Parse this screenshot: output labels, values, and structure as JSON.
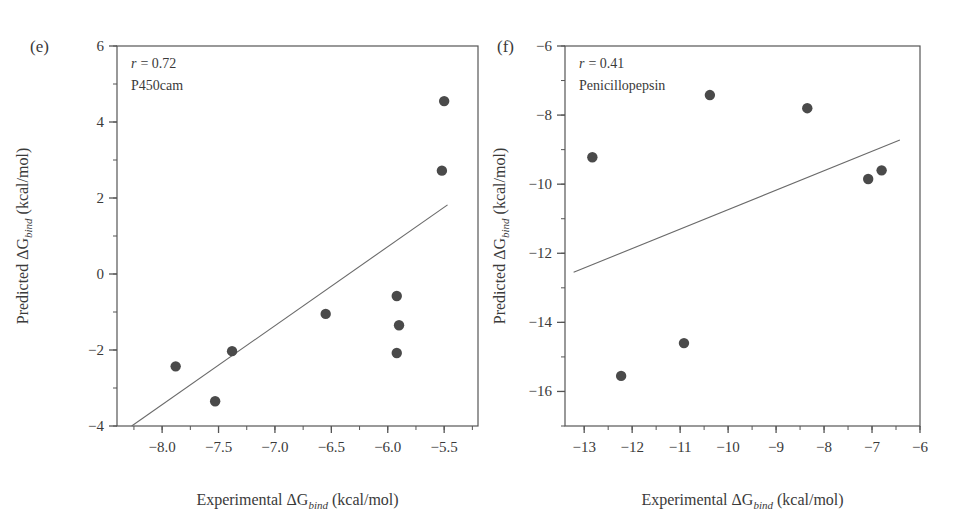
{
  "figure": {
    "background": "#ffffff",
    "marker_color": "#4a4a4a",
    "axis_color": "#555555",
    "line_color": "#6a6a6a"
  },
  "chart_data": [
    {
      "type": "scatter",
      "panel": "(e)",
      "title": "P450cam",
      "correlation_label": "r = 0.72",
      "correlation_symbol": "r",
      "correlation_value": "= 0.72",
      "system": "P450cam",
      "xlabel_prefix": "Experimental ",
      "xlabel_symbol": "ΔG",
      "xlabel_sub": "bind",
      "xlabel_unit": " (kcal/mol)",
      "ylabel_prefix": "Predicted ",
      "ylabel_symbol": "ΔG",
      "ylabel_sub": "bind",
      "ylabel_unit": " (kcal/mol)",
      "xlim": [
        -8.4,
        -5.2
      ],
      "ylim": [
        -4,
        6
      ],
      "xticks": [
        -8.0,
        -7.5,
        -7.0,
        -6.5,
        -6.0,
        -5.5
      ],
      "xticklabels": [
        "−8.0",
        "−7.5",
        "−7.0",
        "−6.5",
        "−6.0",
        "−5.5"
      ],
      "yticks": [
        -4,
        -2,
        0,
        2,
        4,
        6
      ],
      "yticklabels": [
        "−4",
        "−2",
        "0",
        "2",
        "4",
        "6"
      ],
      "x_minor_step": 0.25,
      "y_minor_step": 1,
      "grid": false,
      "legend": "none",
      "points": [
        {
          "x": -7.88,
          "y": -2.43
        },
        {
          "x": -7.53,
          "y": -3.35
        },
        {
          "x": -7.38,
          "y": -2.03
        },
        {
          "x": -6.55,
          "y": -1.05
        },
        {
          "x": -5.92,
          "y": -0.58
        },
        {
          "x": -5.9,
          "y": -1.35
        },
        {
          "x": -5.92,
          "y": -2.08
        },
        {
          "x": -5.52,
          "y": 2.72
        },
        {
          "x": -5.5,
          "y": 4.55
        }
      ],
      "fit_line": {
        "x1": -8.27,
        "y1": -4.0,
        "x2": -5.47,
        "y2": 1.82
      }
    },
    {
      "type": "scatter",
      "panel": "(f)",
      "title": "Penicillopepsin",
      "correlation_label": "r = 0.41",
      "correlation_symbol": "r",
      "correlation_value": "= 0.41",
      "system": "Penicillopepsin",
      "xlabel_prefix": "Experimental ",
      "xlabel_symbol": "ΔG",
      "xlabel_sub": "bind",
      "xlabel_unit": " (kcal/mol)",
      "ylabel_prefix": "Predicted ",
      "ylabel_symbol": "ΔG",
      "ylabel_sub": "bind",
      "ylabel_unit": " (kcal/mol)",
      "xlim": [
        -13.4,
        -6.0
      ],
      "ylim": [
        -17.0,
        -6.0
      ],
      "xticks": [
        -13,
        -12,
        -11,
        -10,
        -9,
        -8,
        -7,
        -6
      ],
      "xticklabels": [
        "−13",
        "−12",
        "−11",
        "−10",
        "−9",
        "−8",
        "−7",
        "−6"
      ],
      "yticks": [
        -16,
        -14,
        -12,
        -10,
        -8,
        -6
      ],
      "yticklabels": [
        "−16",
        "−14",
        "−12",
        "−10",
        "−8",
        "−6"
      ],
      "x_minor_step": 0.5,
      "y_minor_step": 1,
      "grid": false,
      "legend": "none",
      "points": [
        {
          "x": -12.83,
          "y": -9.22
        },
        {
          "x": -12.23,
          "y": -15.55
        },
        {
          "x": -10.92,
          "y": -14.6
        },
        {
          "x": -10.38,
          "y": -7.42
        },
        {
          "x": -8.35,
          "y": -7.8
        },
        {
          "x": -7.08,
          "y": -9.85
        },
        {
          "x": -6.8,
          "y": -9.6
        }
      ],
      "fit_line": {
        "x1": -13.22,
        "y1": -12.55,
        "x2": -6.42,
        "y2": -8.72
      }
    }
  ]
}
